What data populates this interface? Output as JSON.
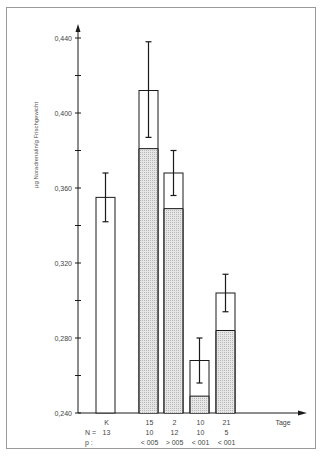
{
  "chart_data": {
    "type": "bar",
    "title": "",
    "ylabel": "µg Noradrenalin/g Frischgewicht",
    "xlabel": "Tage",
    "ylim": [
      0.24,
      0.44
    ],
    "y_ticks": [
      "0,440",
      "0,400",
      "0,360",
      "0,320",
      "0,280",
      "0,240"
    ],
    "y_tick_values": [
      0.44,
      0.4,
      0.36,
      0.32,
      0.28,
      0.24
    ],
    "grid": false,
    "categories": [
      "K",
      "15",
      "2",
      "10",
      "21"
    ],
    "row_labels": {
      "N": "N =",
      "p": "p :"
    },
    "N": [
      "13",
      "10",
      "12",
      "10",
      "5"
    ],
    "p": [
      "",
      "< 005",
      "> 005",
      "< 001",
      "< 001"
    ],
    "values": [
      0.355,
      0.412,
      0.368,
      0.268,
      0.304
    ],
    "shaded_values": [
      null,
      0.381,
      0.349,
      0.249,
      0.284
    ],
    "error_low": [
      0.342,
      0.387,
      0.356,
      0.256,
      0.294
    ],
    "error_high": [
      0.368,
      0.438,
      0.38,
      0.28,
      0.314
    ]
  },
  "colors": {
    "stroke": "#1a1a1a",
    "shade": "#d9d9d9",
    "frame": "#9a9a9a"
  }
}
